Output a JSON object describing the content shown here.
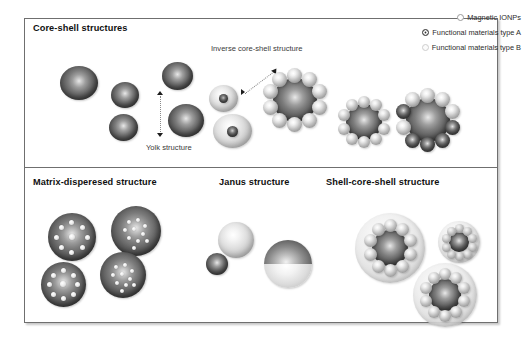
{
  "figure": {
    "panels": [
      {
        "id": "top",
        "title": "Core-shell structures"
      },
      {
        "id": "bottom",
        "titles": [
          "Matrix-disperesed structure",
          "Janus structure",
          "Shell-core-shell structure"
        ]
      }
    ],
    "annotations": {
      "inverse": "Inverse core-shell structure",
      "yolk": "Yolk structure"
    },
    "legend": {
      "items": [
        {
          "label": "Magnetic IONPs",
          "marker": "open-circle-icon",
          "color": "#9a9a9a"
        },
        {
          "label": "Functional materials type A",
          "marker": "bullseye-circle-icon",
          "color": "#2f2f2f"
        },
        {
          "label": "Functional materials type B",
          "marker": "faint-open-circle-icon",
          "color": "#cdcdcd"
        }
      ]
    },
    "colors": {
      "frame_border": "#6f6f6f",
      "title_text": "#101010",
      "note_text": "#3a3a3a",
      "dark_sphere": "#5e5e5e",
      "light_sphere": "#cfcfcf",
      "shell": "#d6d6d6",
      "arrow": "#8a8a8a"
    }
  }
}
